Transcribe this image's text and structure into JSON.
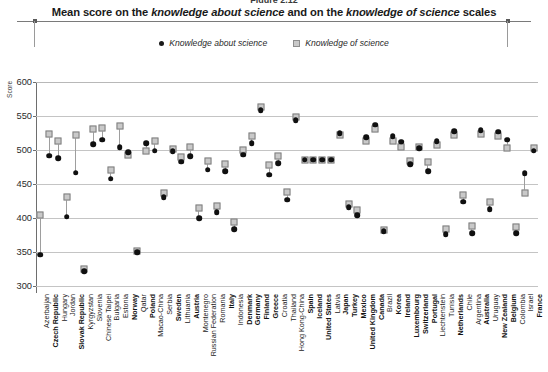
{
  "figure": {
    "number_label": "Figure 2.12",
    "title_part1": "Mean score on the ",
    "title_em1": "knowledge about science",
    "title_part2": " and on the ",
    "title_em2": "knowledge of science",
    "title_part3": " scales"
  },
  "legend": {
    "items": [
      {
        "marker": "circle-marker-icon",
        "label": "Knowledge about science",
        "color": "#101010"
      },
      {
        "marker": "square-marker-icon",
        "label": "Knowledge of science",
        "color": "#c9c9c9"
      }
    ]
  },
  "axes": {
    "y_title": "Score",
    "y_min": 290,
    "y_max": 600,
    "y_ticks": [
      300,
      350,
      400,
      450,
      500,
      550,
      600
    ],
    "grid": true
  },
  "chart_data": {
    "type": "scatter",
    "title": "Mean score on the knowledge about science and on the knowledge of science scales",
    "xlabel": "",
    "ylabel": "Score",
    "ylim": [
      290,
      600
    ],
    "categories": [
      "Azerbaijan",
      "Czech Republic",
      "Hungary",
      "Jordan",
      "Slovak Republic",
      "Kyrgyzstan",
      "Slovenia",
      "Chinese Taipei",
      "Bulgaria",
      "Estonia",
      "Norway",
      "Qatar",
      "Poland",
      "Macao-China",
      "Serbia",
      "Sweden",
      "Lithuania",
      "Austria",
      "Montenegro",
      "Russian Federation",
      "Romania",
      "Italy",
      "Indonesia",
      "Denmark",
      "Germany",
      "Finland",
      "Greece",
      "Croatia",
      "Thailand",
      "Hong Kong-China",
      "Spain",
      "Iceland",
      "United States",
      "Latvia",
      "Japan",
      "Turkey",
      "Mexico",
      "United Kingdom",
      "Canada",
      "Brazil",
      "Korea",
      "Ireland",
      "Luxembourg",
      "Switzerland",
      "Portugal",
      "Liechtenstein",
      "Tunisia",
      "Netherlands",
      "Chile",
      "Argentina",
      "Australia",
      "Uruguay",
      "New Zealand",
      "Belgium",
      "Colombia",
      "Israel",
      "France"
    ],
    "bold_categories": [
      "Czech Republic",
      "Slovak Republic",
      "Norway",
      "Poland",
      "Sweden",
      "Austria",
      "Italy",
      "Denmark",
      "Germany",
      "Finland",
      "Greece",
      "Spain",
      "Iceland",
      "United States",
      "Japan",
      "Turkey",
      "Mexico",
      "United Kingdom",
      "Canada",
      "Korea",
      "Ireland",
      "Luxembourg",
      "Switzerland",
      "Portugal",
      "Netherlands",
      "Australia",
      "New Zealand",
      "Belgium",
      "France"
    ],
    "series": [
      {
        "name": "Knowledge about science",
        "marker": "circle",
        "color": "#101010",
        "values": [
          346,
          492,
          488,
          402,
          467,
          322,
          509,
          515,
          458,
          504,
          497,
          350,
          510,
          499,
          431,
          498,
          483,
          491,
          400,
          471,
          409,
          469,
          384,
          493,
          510,
          559,
          464,
          481,
          427,
          544,
          486,
          486,
          486,
          486,
          525,
          416,
          404,
          519,
          537,
          381,
          520,
          512,
          479,
          503,
          469,
          513,
          376,
          528,
          424,
          378,
          529,
          413,
          527,
          515,
          378,
          466,
          499
        ]
      },
      {
        "name": "Knowledge of science",
        "marker": "square",
        "color": "#c9c9c9",
        "values": [
          405,
          523,
          513,
          431,
          522,
          325,
          531,
          533,
          470,
          536,
          493,
          352,
          499,
          514,
          437,
          501,
          490,
          505,
          415,
          484,
          418,
          480,
          395,
          500,
          520,
          563,
          478,
          492,
          439,
          549,
          486,
          486,
          486,
          486,
          522,
          421,
          412,
          513,
          531,
          382,
          513,
          505,
          484,
          505,
          482,
          508,
          384,
          522,
          434,
          389,
          523,
          424,
          521,
          503,
          387,
          437,
          503
        ]
      }
    ]
  }
}
